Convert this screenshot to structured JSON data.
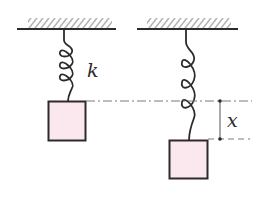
{
  "diagram": {
    "type": "spring-mass",
    "colors": {
      "stroke": "#2e2a2b",
      "block_fill": "#fbe8ee",
      "guide_line": "#7a7a7a"
    },
    "labels": {
      "spring_constant": "k",
      "displacement": "x"
    },
    "left_setup": {
      "ceiling": "hatched-ceiling",
      "spring": "spring",
      "mass": "block",
      "state": "equilibrium"
    },
    "right_setup": {
      "ceiling": "hatched-ceiling",
      "spring": "spring",
      "mass": "block",
      "state": "displaced"
    }
  }
}
